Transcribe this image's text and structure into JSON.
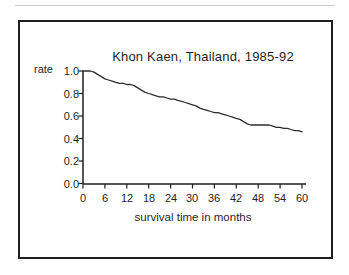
{
  "chart_data": {
    "type": "line",
    "title": "Khon Kaen, Thailand, 1985-92",
    "xlabel": "survival time in months",
    "ylabel": "rate",
    "xlim": [
      0,
      60
    ],
    "ylim": [
      0.0,
      1.0
    ],
    "grid": false,
    "legend": "none",
    "axis_color": "#1f1f1f",
    "line_color": "#2e2e2e",
    "background_color": "#ffffff",
    "x_ticks": [
      0,
      6,
      12,
      18,
      24,
      30,
      36,
      42,
      48,
      54,
      60
    ],
    "y_ticks": [
      1.0,
      0.8,
      0.6,
      0.4,
      0.2,
      0.0
    ],
    "y_tick_labels": [
      "1.0",
      "0.8",
      "0.6",
      "0.4",
      "0.2",
      "0.0"
    ],
    "series": [
      {
        "name": "survival rate",
        "x": [
          0,
          1,
          2,
          3,
          4,
          5,
          6,
          7,
          8,
          9,
          10,
          11,
          12,
          13,
          14,
          15,
          16,
          17,
          18,
          19,
          20,
          21,
          22,
          23,
          24,
          25,
          26,
          27,
          28,
          29,
          30,
          31,
          32,
          33,
          34,
          35,
          36,
          37,
          38,
          39,
          40,
          41,
          42,
          43,
          44,
          45,
          46,
          47,
          48,
          49,
          50,
          51,
          52,
          53,
          54,
          55,
          56,
          57,
          58,
          59,
          60
        ],
        "y": [
          1.0,
          1.0,
          1.0,
          0.99,
          0.97,
          0.95,
          0.93,
          0.92,
          0.91,
          0.9,
          0.89,
          0.89,
          0.88,
          0.88,
          0.87,
          0.85,
          0.83,
          0.81,
          0.8,
          0.79,
          0.78,
          0.77,
          0.77,
          0.76,
          0.75,
          0.75,
          0.74,
          0.73,
          0.72,
          0.71,
          0.7,
          0.69,
          0.67,
          0.66,
          0.65,
          0.64,
          0.63,
          0.63,
          0.62,
          0.61,
          0.6,
          0.59,
          0.58,
          0.57,
          0.55,
          0.53,
          0.52,
          0.52,
          0.52,
          0.52,
          0.52,
          0.52,
          0.51,
          0.5,
          0.5,
          0.49,
          0.49,
          0.48,
          0.47,
          0.47,
          0.46
        ]
      }
    ]
  }
}
